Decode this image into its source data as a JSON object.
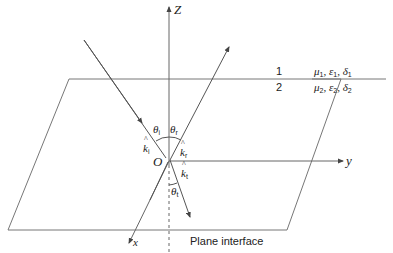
{
  "diagram": {
    "axes": {
      "z": "Z",
      "y": "y",
      "x": "x",
      "origin": "O"
    },
    "regions": {
      "upper": "1",
      "lower": "2"
    },
    "media": {
      "medium1": "μ1, ε1, δ1",
      "medium2": "μ2, ε2, δ2",
      "medium1_parts": {
        "mu": "μ",
        "eps": "ε",
        "delta": "δ",
        "idx": "1"
      },
      "medium2_parts": {
        "mu": "μ",
        "eps": "ε",
        "delta": "δ",
        "idx": "2"
      }
    },
    "angles": {
      "incident": {
        "symbol": "θ",
        "sub": "i"
      },
      "reflected": {
        "symbol": "θ",
        "sub": "r"
      },
      "transmitted": {
        "symbol": "θ",
        "sub": "t"
      }
    },
    "wave_vectors": {
      "incident": {
        "symbol": "k",
        "sub": "i"
      },
      "reflected": {
        "symbol": "k",
        "sub": "r"
      },
      "transmitted": {
        "symbol": "k",
        "sub": "t"
      }
    },
    "plane_label": "Plane interface",
    "colors": {
      "line": "#555555",
      "text": "#222222",
      "background": "#ffffff"
    }
  }
}
